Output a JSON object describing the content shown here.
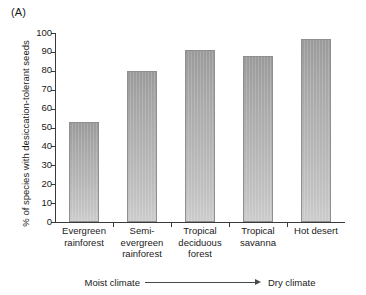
{
  "panel_label": "(A)",
  "chart_data": {
    "type": "bar",
    "title": "",
    "subtitle": "",
    "xlabel": "",
    "ylabel": "% of species with desiccation-tolerant seeds",
    "ylim": [
      0,
      100
    ],
    "yticks": [
      0,
      10,
      20,
      30,
      40,
      50,
      60,
      70,
      80,
      90,
      100
    ],
    "grid": false,
    "legend": false,
    "categories": [
      "Evergreen rainforest",
      "Semi-evergreen rainforest",
      "Tropical deciduous forest",
      "Tropical savanna",
      "Hot desert"
    ],
    "category_label_lines": [
      [
        "Evergreen",
        "rainforest"
      ],
      [
        "Semi-",
        "evergreen",
        "rainforest"
      ],
      [
        "Tropical",
        "deciduous",
        "forest"
      ],
      [
        "Tropical",
        "savanna"
      ],
      [
        "Hot desert"
      ]
    ],
    "values": [
      53,
      80,
      91,
      88,
      97
    ],
    "annotations": {
      "axis_gradient_left": "Moist climate",
      "axis_gradient_right": "Dry climate",
      "axis_gradient_arrow": "arrow-right"
    },
    "colors": {
      "bar_top": "#9a9a9a",
      "bar_bottom": "#cccccc",
      "bar_border": "#8f8f8f",
      "axis": "#3a3a3a",
      "text": "#1a1a1a"
    }
  }
}
